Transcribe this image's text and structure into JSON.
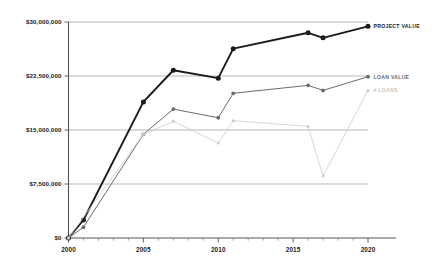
{
  "chart_data": {
    "type": "line",
    "title": "",
    "xlabel": "",
    "ylabel": "",
    "xlim": [
      2000,
      2020
    ],
    "ylim": [
      0,
      30000000
    ],
    "grid": true,
    "legend_position": "inline-right",
    "x_tick_labels": [
      "2000",
      "2005",
      "2010",
      "2015",
      "2020"
    ],
    "x_tick_values": [
      2000,
      2005,
      2010,
      2015,
      2020
    ],
    "x_minor_ticks": [
      2001,
      2002,
      2003,
      2004,
      2006,
      2007,
      2008,
      2009,
      2011,
      2012,
      2013,
      2014,
      2016,
      2017,
      2018,
      2019
    ],
    "y_tick_labels": [
      "$0",
      "$7,500,000",
      "$15,000,000",
      "$22,500,000",
      "$30,000,000"
    ],
    "y_tick_values": [
      0,
      7500000,
      15000000,
      22500000,
      30000000
    ],
    "series": [
      {
        "name": "PROJECT VALUE",
        "label": "PROJECT VALUE",
        "color": "#1a1a1a",
        "x": [
          2000,
          2001,
          2005,
          2007,
          2010,
          2011,
          2016,
          2017,
          2020
        ],
        "values": [
          0,
          2500000,
          18900000,
          23300000,
          22200000,
          26300000,
          28500000,
          27800000,
          29400000
        ]
      },
      {
        "name": "LOAN VALUE",
        "label": "LOAN VALUE",
        "color": "#6b6b6b",
        "x": [
          2000,
          2001,
          2005,
          2007,
          2010,
          2011,
          2016,
          2017,
          2020
        ],
        "values": [
          0,
          1500000,
          14400000,
          17900000,
          16700000,
          20100000,
          21200000,
          20500000,
          22400000
        ]
      },
      {
        "name": "# LOANS",
        "label": "# LOANS",
        "color": "#cccccc",
        "x": [
          2000,
          2005,
          2007,
          2010,
          2011,
          2016,
          2017,
          2020
        ],
        "values": [
          0,
          14400000,
          16200000,
          13200000,
          16300000,
          15500000,
          8600000,
          20500000
        ]
      }
    ]
  }
}
